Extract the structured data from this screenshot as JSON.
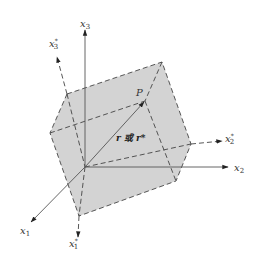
{
  "diagram": {
    "title": "",
    "labels": {
      "x1": "x",
      "x1_sub": "1",
      "x2": "x",
      "x2_sub": "2",
      "x3": "x",
      "x3_sub": "3",
      "x1_star": "x",
      "x1_star_sub": "1",
      "x1_star_sup": "*",
      "x2_star": "x",
      "x2_star_sub": "2",
      "x2_star_sup": "*",
      "x3_star": "x",
      "x3_star_sub": "3",
      "x3_star_sup": "*",
      "point": "P",
      "vector": "r 或 r*"
    },
    "colors": {
      "background": "#ffffff",
      "box_fill": "#d3d3d3",
      "line": "#444444"
    }
  }
}
